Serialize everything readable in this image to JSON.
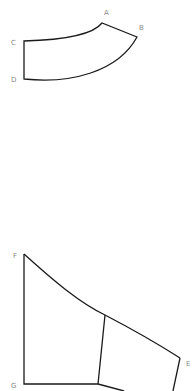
{
  "diagram": {
    "top_shape": {
      "description": "Curved strip (annular sector-like piece)",
      "labels": {
        "A": "A",
        "B": "B",
        "C": "C",
        "D": "D"
      },
      "points": {
        "A": [
          102,
          23
        ],
        "B": [
          137,
          37
        ],
        "C": [
          24,
          41
        ],
        "D": [
          24,
          79
        ]
      }
    },
    "bottom_shape": {
      "description": "Quadrilateral region with curved top edge, divided by an interior line",
      "labels": {
        "E": "E",
        "F": "F",
        "G": "G"
      },
      "points": {
        "F": [
          24,
          254
        ],
        "G": [
          24,
          384
        ],
        "E": [
          180,
          358
        ],
        "mid_top": [
          105,
          315
        ],
        "mid_bottom": [
          98,
          384
        ]
      }
    },
    "colors": {
      "stroke": "#1a1a1a",
      "label": "#8a8a8a",
      "background": "#ffffff"
    }
  }
}
